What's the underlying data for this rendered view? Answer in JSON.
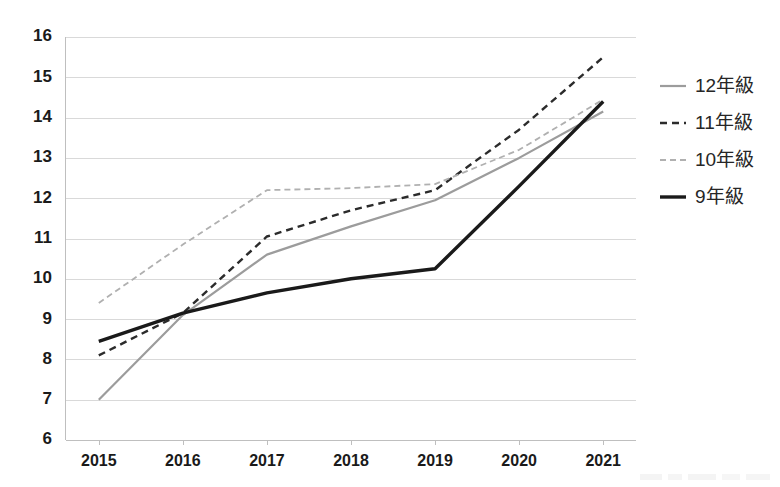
{
  "chart_data": {
    "type": "line",
    "title": "",
    "subtitle": "",
    "xlabel": "",
    "ylabel": "",
    "categories": [
      "2015",
      "2016",
      "2017",
      "2018",
      "2019",
      "2020",
      "2021"
    ],
    "x": [
      2015,
      2016,
      2017,
      2018,
      2019,
      2020,
      2021
    ],
    "ylim": [
      6,
      16
    ],
    "yticks": [
      6,
      7,
      8,
      9,
      10,
      11,
      12,
      13,
      14,
      15,
      16
    ],
    "ytick_labels": [
      "6",
      "7",
      "8",
      "9",
      "10",
      "11",
      "12",
      "13",
      "14",
      "15",
      "16"
    ],
    "grid": "horizontal",
    "legend_position": "right",
    "series": [
      {
        "name": "12年級",
        "style": "solid",
        "color": "#9c9c9c",
        "width": 2.2,
        "dash": "none",
        "values": [
          7.0,
          9.1,
          10.6,
          11.3,
          11.95,
          13.0,
          14.15
        ]
      },
      {
        "name": "11年級",
        "style": "dashed",
        "color": "#2b2b2b",
        "width": 2.4,
        "dash": "7,5",
        "values": [
          8.1,
          9.15,
          11.05,
          11.7,
          12.2,
          13.7,
          15.5
        ]
      },
      {
        "name": "10年級",
        "style": "dashed",
        "color": "#b0b0b0",
        "width": 1.8,
        "dash": "6,4",
        "values": [
          9.4,
          10.85,
          12.2,
          12.25,
          12.35,
          13.2,
          14.45
        ]
      },
      {
        "name": "9年級",
        "style": "solid",
        "color": "#1a1a1a",
        "width": 3.4,
        "dash": "none",
        "values": [
          8.45,
          9.15,
          9.65,
          10.0,
          10.25,
          12.3,
          14.4
        ]
      }
    ]
  },
  "legend": {
    "entries": [
      {
        "label": "12年級"
      },
      {
        "label": "11年級"
      },
      {
        "label": "10年級"
      },
      {
        "label": "9年級"
      }
    ]
  },
  "colors": {
    "gridline": "#d9d9d9",
    "axis": "#bfbfbf",
    "text": "#1a1a1a",
    "background": "#ffffff"
  }
}
